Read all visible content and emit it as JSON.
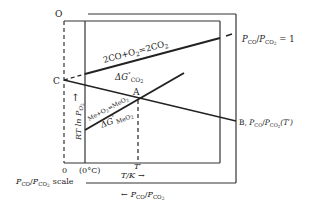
{
  "diagram": {
    "type": "ellingham-diagram",
    "labels": {
      "origin_top": "O",
      "point_c": "C",
      "point_a": "A",
      "point_b_prefix": "B, ",
      "ratio_p": "P",
      "sub_co": "CO",
      "sub_co2": "CO",
      "sub_2": "2",
      "ratio_eq_one": " = 1",
      "b_temp": "(T′)",
      "reaction_co": "2CO+O",
      "reaction_co_sub": "2",
      "reaction_co_rhs": "=2CO",
      "reaction_co_rhs_sub": "2",
      "delta_g": "ΔG",
      "delta_g_sup": "°",
      "delta_g_co2_sub": "CO",
      "delta_g_co2_sub2": "2",
      "reaction_me": "Me+O",
      "reaction_me_sub": "2",
      "reaction_me_rhs": "=MeO",
      "reaction_me_rhs_sub": "2",
      "delta_g_meo2_sub": "MeO",
      "delta_g_meo2_sub2": "2",
      "y_axis": "RT ln P",
      "y_axis_sub": "O",
      "y_axis_sub2": "2",
      "x_zero": "0",
      "x_zero_c": "(0°C)",
      "x_tprime": "T′",
      "x_axis": "T/K",
      "arrow_right": "→",
      "arrow_left": "←",
      "arrow_up": "↑",
      "scale_label": "scale",
      "slash": "/"
    }
  }
}
